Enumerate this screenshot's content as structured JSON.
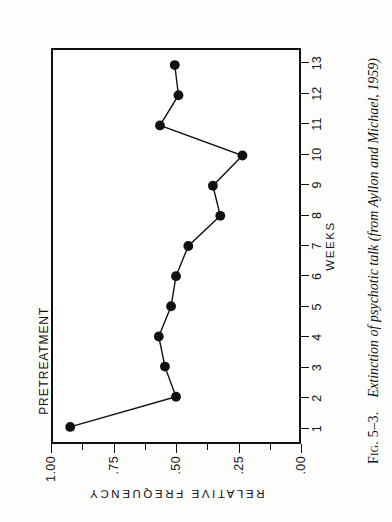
{
  "figure": {
    "caption_label": "Fig. 5–3.",
    "caption_text": "Extinction of psychotic talk (from Ayllon and Michael, 1959)"
  },
  "annotations": [
    {
      "name": "pretreatment-label",
      "text": "PRETREATMENT"
    }
  ],
  "chart_data": {
    "type": "line",
    "title": "",
    "xlabel": "WEEKS",
    "ylabel": "RELATIVE FREQUENCY",
    "x": [
      1,
      2,
      3,
      4,
      5,
      6,
      7,
      8,
      9,
      10,
      11,
      12,
      13
    ],
    "values": [
      0.93,
      0.5,
      0.545,
      0.57,
      0.52,
      0.5,
      0.45,
      0.32,
      0.35,
      0.23,
      0.565,
      0.49,
      0.505
    ],
    "xtick_labels": [
      "1",
      "2",
      "3",
      "4",
      "5",
      "6",
      "7",
      "8",
      "9",
      "10",
      "11",
      "12",
      "13"
    ],
    "ytick_labels": [
      "1.00",
      ".75",
      ".50",
      ".25",
      ".00"
    ],
    "ytick_values": [
      1.0,
      0.75,
      0.5,
      0.25,
      0.0
    ],
    "yminor_values": [
      0.875,
      0.625,
      0.375,
      0.125
    ],
    "xlim": [
      0.5,
      13.5
    ],
    "ylim": [
      0.0,
      1.0
    ],
    "grid": false,
    "legend": "none",
    "marker": "filled-circle",
    "marker_color": "#111111",
    "line_color": "#111111",
    "annotations": [
      {
        "label": "PRETREATMENT",
        "x": 1,
        "y": 0.93
      }
    ]
  },
  "colors": {
    "ink": "#111111",
    "paper": "#fdfdfb"
  }
}
